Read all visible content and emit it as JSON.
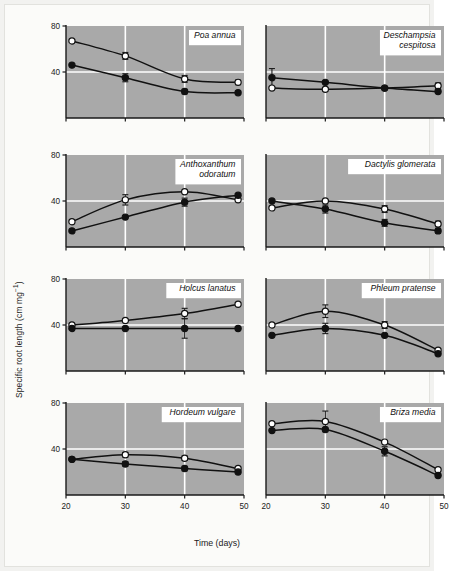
{
  "figure": {
    "xlabel": "Time (days)",
    "ylabel_main": "Specific root length (cm mg",
    "ylabel_sup": "−1",
    "ylabel_close": ")",
    "ylabel_full": "Specific root length (cm mg⁻¹)"
  },
  "chart_data": {
    "type": "line",
    "xlabel": "Time (days)",
    "ylabel": "Specific root length (cm mg⁻¹)",
    "xlim": [
      20,
      50
    ],
    "ylim": [
      0,
      80
    ],
    "xticks": [
      20,
      30,
      40,
      50
    ],
    "xticklabels": [
      "20",
      "30",
      "40",
      "50"
    ],
    "yticks": [
      40,
      80
    ],
    "yticklabels": [
      "40",
      "80"
    ],
    "grid": "white gridlines at x = 30, 40 and y = 40",
    "legend": "none shown; open circles and filled circles denote two treatments",
    "series_markers": [
      "open-circle",
      "filled-circle"
    ],
    "panel_layout": "4 rows x 2 columns",
    "panels": [
      {
        "row": 0,
        "col": 0,
        "title": "Poa annua",
        "title_lines": [
          "Poa annua"
        ],
        "yticklabels": [
          "80",
          "40"
        ],
        "xticklabels_shown": false,
        "x": [
          21,
          30,
          40,
          49
        ],
        "series": [
          {
            "name": "open",
            "marker": "open-circle",
            "values": [
              67,
              54,
              34,
              31
            ],
            "errors": [
              0,
              6,
              6,
              4
            ]
          },
          {
            "name": "filled",
            "marker": "filled-circle",
            "values": [
              46,
              35,
              23,
              22
            ],
            "errors": [
              0,
              7,
              4,
              3
            ]
          }
        ]
      },
      {
        "row": 0,
        "col": 1,
        "title": "Deschampsia cespitosa",
        "title_lines": [
          "Deschampsia",
          "cespitosa"
        ],
        "yticklabels": [],
        "xticklabels_shown": false,
        "x": [
          21,
          30,
          40,
          49
        ],
        "series": [
          {
            "name": "open",
            "marker": "open-circle",
            "values": [
              26,
              25,
              26,
              28
            ],
            "errors": [
              0,
              3,
              0,
              5
            ]
          },
          {
            "name": "filled",
            "marker": "filled-circle",
            "values": [
              35,
              31,
              26,
              23
            ],
            "errors": [
              16,
              0,
              0,
              0
            ]
          }
        ]
      },
      {
        "row": 1,
        "col": 0,
        "title": "Anthoxanthum odoratum",
        "title_lines": [
          "Anthoxanthum",
          "odoratum"
        ],
        "yticklabels": [
          "80",
          "40"
        ],
        "xticklabels_shown": false,
        "x": [
          21,
          30,
          40,
          49
        ],
        "series": [
          {
            "name": "open",
            "marker": "open-circle",
            "values": [
              22,
              41,
              48,
              41
            ],
            "errors": [
              0,
              9,
              0,
              0
            ]
          },
          {
            "name": "filled",
            "marker": "filled-circle",
            "values": [
              14,
              26,
              39,
              45
            ],
            "errors": [
              0,
              0,
              7,
              0
            ]
          }
        ]
      },
      {
        "row": 1,
        "col": 1,
        "title": "Dactylis glomerata",
        "title_lines": [
          "Dactylis glomerata"
        ],
        "yticklabels": [],
        "xticklabels_shown": false,
        "x": [
          21,
          30,
          40,
          49
        ],
        "series": [
          {
            "name": "open",
            "marker": "open-circle",
            "values": [
              34,
              40,
              33,
              20
            ],
            "errors": [
              0,
              0,
              6,
              5
            ]
          },
          {
            "name": "filled",
            "marker": "filled-circle",
            "values": [
              40,
              33,
              21,
              14
            ],
            "errors": [
              0,
              7,
              6,
              4
            ]
          }
        ]
      },
      {
        "row": 2,
        "col": 0,
        "title": "Holcus lanatus",
        "title_lines": [
          "Holcus lanatus"
        ],
        "yticklabels": [
          "80",
          "40"
        ],
        "xticklabels_shown": false,
        "x": [
          21,
          30,
          40,
          49
        ],
        "series": [
          {
            "name": "open",
            "marker": "open-circle",
            "values": [
              40,
              44,
              50,
              58
            ],
            "errors": [
              0,
              0,
              9,
              0
            ]
          },
          {
            "name": "filled",
            "marker": "filled-circle",
            "values": [
              37,
              37,
              37,
              37
            ],
            "errors": [
              0,
              0,
              17,
              0
            ]
          }
        ]
      },
      {
        "row": 2,
        "col": 1,
        "title": "Phleum pratense",
        "title_lines": [
          "Phleum pratense"
        ],
        "yticklabels": [],
        "xticklabels_shown": false,
        "x": [
          21,
          30,
          40,
          49
        ],
        "series": [
          {
            "name": "open",
            "marker": "open-circle",
            "values": [
              40,
              52,
              40,
              18
            ],
            "errors": [
              0,
              11,
              6,
              0
            ]
          },
          {
            "name": "filled",
            "marker": "filled-circle",
            "values": [
              31,
              37,
              31,
              15
            ],
            "errors": [
              0,
              9,
              0,
              0
            ]
          }
        ]
      },
      {
        "row": 3,
        "col": 0,
        "title": "Hordeum vulgare",
        "title_lines": [
          "Hordeum vulgare"
        ],
        "yticklabels": [
          "80",
          "40"
        ],
        "xticklabels_shown": true,
        "x": [
          21,
          30,
          40,
          49
        ],
        "series": [
          {
            "name": "open",
            "marker": "open-circle",
            "values": [
              31,
              35,
              32,
              23
            ],
            "errors": [
              0,
              4,
              4,
              0
            ]
          },
          {
            "name": "filled",
            "marker": "filled-circle",
            "values": [
              31,
              27,
              23,
              20
            ],
            "errors": [
              0,
              4,
              4,
              0
            ]
          }
        ]
      },
      {
        "row": 3,
        "col": 1,
        "title": "Briza media",
        "title_lines": [
          "Briza media"
        ],
        "yticklabels": [],
        "xticklabels_shown": true,
        "x": [
          21,
          30,
          40,
          49
        ],
        "series": [
          {
            "name": "open",
            "marker": "open-circle",
            "values": [
              62,
              64,
              46,
              22
            ],
            "errors": [
              0,
              18,
              0,
              0
            ]
          },
          {
            "name": "filled",
            "marker": "filled-circle",
            "values": [
              56,
              57,
              38,
              17
            ],
            "errors": [
              0,
              0,
              8,
              0
            ]
          }
        ]
      }
    ]
  },
  "style": {
    "plot_background": "#a9a9a9",
    "gridline_color": "#ffffff",
    "axis_color": "#1a1a1a",
    "line_color": "#111111",
    "page_background": "#fbfbf9",
    "label_box_background": "#ffffff"
  }
}
